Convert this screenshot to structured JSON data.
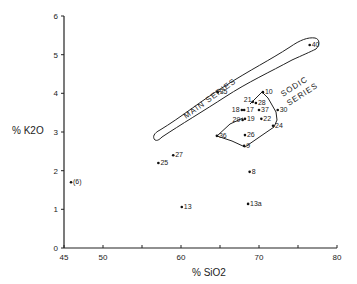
{
  "chart_data": {
    "type": "scatter",
    "title": "",
    "xlabel": "% SiO2",
    "ylabel": "% K2O",
    "xlim": [
      45,
      80
    ],
    "ylim": [
      0,
      6
    ],
    "x_ticks": [
      "45",
      "50",
      "60",
      "70",
      "80"
    ],
    "x_minor_ticks": [
      55,
      65,
      75
    ],
    "y_ticks": [
      "0",
      "1",
      "2",
      "3",
      "4",
      "5",
      "6"
    ],
    "grid": false,
    "annotations": [
      "MAIN SERIES",
      "SODIC SERIES"
    ],
    "points": [
      {
        "label": "(6)",
        "x": 45.9,
        "y": 1.7
      },
      {
        "label": "25",
        "x": 57.1,
        "y": 2.2
      },
      {
        "label": "27",
        "x": 59.0,
        "y": 2.4
      },
      {
        "label": "13",
        "x": 60.1,
        "y": 1.06
      },
      {
        "label": "8",
        "x": 68.8,
        "y": 1.97
      },
      {
        "label": "13a",
        "x": 68.6,
        "y": 1.14
      },
      {
        "label": "9",
        "x": 68.1,
        "y": 2.64
      },
      {
        "label": "26",
        "x": 68.2,
        "y": 2.92
      },
      {
        "label": "36",
        "x": 64.6,
        "y": 2.9
      },
      {
        "label": "29",
        "x": 67.9,
        "y": 3.31
      },
      {
        "label": "19",
        "x": 68.2,
        "y": 3.34
      },
      {
        "label": "22",
        "x": 70.3,
        "y": 3.34
      },
      {
        "label": "24",
        "x": 71.8,
        "y": 3.16
      },
      {
        "label": "18",
        "x": 67.8,
        "y": 3.57
      },
      {
        "label": "17",
        "x": 68.1,
        "y": 3.57
      },
      {
        "label": "37",
        "x": 70.0,
        "y": 3.57
      },
      {
        "label": "30",
        "x": 72.4,
        "y": 3.57
      },
      {
        "label": "21",
        "x": 69.2,
        "y": 3.78
      },
      {
        "label": "28",
        "x": 69.6,
        "y": 3.75
      },
      {
        "label": "10",
        "x": 70.5,
        "y": 4.03
      },
      {
        "label": "35",
        "x": 64.7,
        "y": 4.03
      },
      {
        "label": "40",
        "x": 76.5,
        "y": 5.25
      }
    ]
  }
}
